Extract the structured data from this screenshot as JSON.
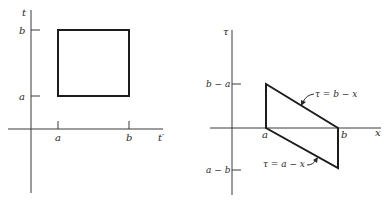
{
  "left_panel": {
    "y_axis_label": "t",
    "x_axis_label": "t′",
    "y_ticks": [
      "b",
      "a"
    ],
    "x_ticks": [
      "a",
      "b"
    ],
    "region": "square [a,b] × [a,b]"
  },
  "right_panel": {
    "y_axis_label": "τ",
    "x_axis_label": "x",
    "y_ticks": [
      "b − a",
      "a − b"
    ],
    "x_ticks": [
      "a",
      "b"
    ],
    "upper_line_label": "τ = b − x",
    "lower_line_label": "τ = a − x",
    "region": "parallelogram"
  },
  "colors": {
    "ink": "#1c1c1c",
    "background": "#ffffff"
  }
}
